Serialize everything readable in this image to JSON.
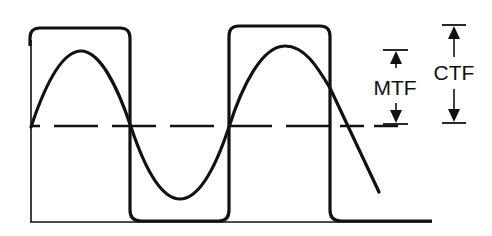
{
  "diagram": {
    "colors": {
      "stroke": "#111111",
      "background": "#ffffff"
    },
    "labels": {
      "mtf": "MTF",
      "ctf": "CTF"
    },
    "elements": {
      "square_wave": "square-wave",
      "sine_wave": "sine-wave",
      "mean_line": "dashed-mean-line",
      "baseline": "baseline",
      "mtf_marker": "mtf-amplitude-arrow",
      "ctf_marker": "ctf-amplitude-arrow"
    }
  }
}
